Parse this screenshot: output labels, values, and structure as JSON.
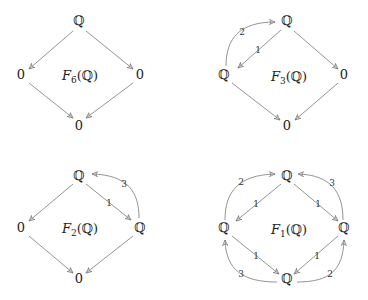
{
  "diagrams": [
    {
      "id": "F6",
      "title": {
        "name": "F",
        "sub": "6",
        "arg": "(ℚ)"
      },
      "nodes": {
        "top": "ℚ",
        "left": "0",
        "right": "0",
        "bottom": "0"
      },
      "edges": [
        {
          "from": "top",
          "to": "left",
          "label": ""
        },
        {
          "from": "top",
          "to": "right",
          "label": ""
        },
        {
          "from": "left",
          "to": "bottom",
          "label": ""
        },
        {
          "from": "right",
          "to": "bottom",
          "label": ""
        }
      ]
    },
    {
      "id": "F3",
      "title": {
        "name": "F",
        "sub": "3",
        "arg": "(ℚ)"
      },
      "nodes": {
        "top": "ℚ",
        "left": "ℚ",
        "right": "0",
        "bottom": "0"
      },
      "edges": [
        {
          "from": "top",
          "to": "left",
          "label": "1"
        },
        {
          "from": "left",
          "to": "top",
          "label": "2",
          "curved": true
        },
        {
          "from": "top",
          "to": "right",
          "label": ""
        },
        {
          "from": "left",
          "to": "bottom",
          "label": ""
        },
        {
          "from": "right",
          "to": "bottom",
          "label": ""
        }
      ]
    },
    {
      "id": "F2",
      "title": {
        "name": "F",
        "sub": "2",
        "arg": "(ℚ)"
      },
      "nodes": {
        "top": "ℚ",
        "left": "0",
        "right": "ℚ",
        "bottom": "0"
      },
      "edges": [
        {
          "from": "top",
          "to": "left",
          "label": ""
        },
        {
          "from": "top",
          "to": "right",
          "label": "1"
        },
        {
          "from": "right",
          "to": "top",
          "label": "3",
          "curved": true
        },
        {
          "from": "left",
          "to": "bottom",
          "label": ""
        },
        {
          "from": "right",
          "to": "bottom",
          "label": ""
        }
      ]
    },
    {
      "id": "F1",
      "title": {
        "name": "F",
        "sub": "1",
        "arg": "(ℚ)"
      },
      "nodes": {
        "top": "ℚ",
        "left": "ℚ",
        "right": "ℚ",
        "bottom": "ℚ"
      },
      "edges": [
        {
          "from": "top",
          "to": "left",
          "label": "1"
        },
        {
          "from": "top",
          "to": "right",
          "label": "1"
        },
        {
          "from": "left",
          "to": "bottom",
          "label": "1"
        },
        {
          "from": "right",
          "to": "bottom",
          "label": "1"
        },
        {
          "from": "left",
          "to": "top",
          "label": "2",
          "curved": true
        },
        {
          "from": "right",
          "to": "top",
          "label": "3",
          "curved": true
        },
        {
          "from": "bottom",
          "to": "left",
          "label": "3",
          "curved": true
        },
        {
          "from": "bottom",
          "to": "right",
          "label": "2",
          "curved": true
        }
      ]
    }
  ]
}
